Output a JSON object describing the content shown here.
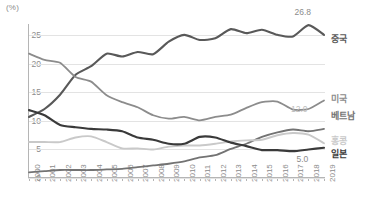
{
  "chart_data": {
    "type": "line",
    "title": "",
    "subtitle": "",
    "xlabel": "",
    "ylabel": "",
    "unit_label": "(%)",
    "x": [
      "2000",
      "2001",
      "2002",
      "2003",
      "2004",
      "2005",
      "2006",
      "2007",
      "2008",
      "2009",
      "2010",
      "2011",
      "2012",
      "2013",
      "2014",
      "2015",
      "2016",
      "2017",
      "2018",
      "2019"
    ],
    "categories": [
      "2000",
      "2001",
      "2002",
      "2003",
      "2004",
      "2005",
      "2006",
      "2007",
      "2008",
      "2009",
      "2010",
      "2011",
      "2012",
      "2013",
      "2014",
      "2015",
      "2016",
      "2017",
      "2018",
      "2019"
    ],
    "ylim": [
      0,
      27
    ],
    "yticks": [
      "0",
      "5",
      "10",
      "15",
      "20",
      "25"
    ],
    "ytick_values": [
      0,
      5,
      10,
      15,
      20,
      25
    ],
    "grid": true,
    "legend_position": "right-of-plot",
    "series": [
      {
        "name": "중국",
        "color": "#595959",
        "width": 2.1,
        "values": [
          10.7,
          12.1,
          14.6,
          18.1,
          19.6,
          21.8,
          21.3,
          22.1,
          21.7,
          23.9,
          25.1,
          24.2,
          24.5,
          26.1,
          25.4,
          26.0,
          25.1,
          24.8,
          26.8,
          25.1
        ],
        "end_label": "26.8",
        "end_label_year": "2018"
      },
      {
        "name": "미국",
        "color": "#8c8c8c",
        "width": 1.8,
        "values": [
          21.8,
          20.7,
          20.2,
          17.7,
          16.9,
          14.5,
          13.3,
          12.4,
          11.0,
          10.4,
          10.7,
          10.1,
          10.7,
          11.1,
          12.3,
          13.3,
          13.4,
          12.0,
          12.1,
          13.6
        ],
        "end_label": "12.0",
        "end_label_year": "2017"
      },
      {
        "name": "베트남",
        "color": "#737373",
        "width": 1.8,
        "values": [
          1.0,
          1.2,
          1.4,
          1.4,
          1.4,
          1.5,
          1.6,
          1.9,
          2.2,
          2.5,
          2.9,
          3.6,
          4.0,
          5.1,
          6.0,
          7.2,
          8.0,
          8.5,
          8.2,
          8.6
        ],
        "end_label": "",
        "end_label_year": ""
      },
      {
        "name": "홍콩",
        "color": "#c9c9c9",
        "width": 1.9,
        "values": [
          6.3,
          6.3,
          6.3,
          7.1,
          7.3,
          6.3,
          5.2,
          5.2,
          5.0,
          5.5,
          5.7,
          5.7,
          6.0,
          6.4,
          6.6,
          6.7,
          7.5,
          7.9,
          7.6,
          6.1
        ],
        "end_label": "",
        "end_label_year": ""
      },
      {
        "name": "일본",
        "color": "#3a3a3a",
        "width": 2.2,
        "values": [
          11.9,
          11.0,
          9.3,
          8.9,
          8.6,
          8.5,
          8.2,
          7.1,
          6.7,
          6.0,
          6.0,
          7.2,
          7.1,
          6.2,
          5.6,
          4.9,
          4.9,
          4.7,
          5.0,
          5.3
        ],
        "end_label": "5.0",
        "end_label_year": "2018"
      }
    ],
    "annotations": [
      {
        "text": "26.8",
        "series": "중국",
        "color": "#8c8c8c"
      },
      {
        "text": "12.0",
        "series": "미국",
        "color": "#bdbdbd"
      },
      {
        "text": "5.0",
        "series": "일본",
        "color": "#8c8c8c"
      }
    ]
  },
  "legend": {
    "items": [
      {
        "label": "중국",
        "color": "#595959"
      },
      {
        "label": "미국",
        "color": "#8c8c8c"
      },
      {
        "label": "베트남",
        "color": "#737373"
      },
      {
        "label": "홍콩",
        "color": "#c9c9c9"
      },
      {
        "label": "일본",
        "color": "#3a3a3a"
      }
    ]
  }
}
